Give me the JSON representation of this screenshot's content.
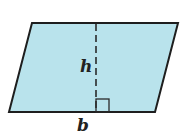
{
  "diagram": {
    "shape": "parallelogram",
    "fill_color": "#b9e3ec",
    "stroke_color": "#1e1e1e",
    "vertices": [
      [
        32,
        23
      ],
      [
        178,
        23
      ],
      [
        155,
        112
      ],
      [
        9,
        112
      ]
    ],
    "height_line": {
      "x": 96,
      "y1": 23,
      "y2": 112,
      "style": "dashed"
    },
    "right_angle_marker": {
      "x": 96,
      "y": 100,
      "size": 13
    },
    "labels": {
      "height": "h",
      "base": "b"
    }
  }
}
